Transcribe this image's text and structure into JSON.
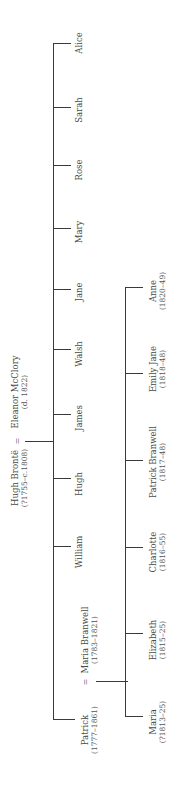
{
  "diagram": {
    "type": "family-tree",
    "orientation": "rotated-90-ccw",
    "line_color": "#3a3a3a",
    "text_color": "#4a4a4a",
    "marriage_symbol": "=",
    "generation1": {
      "husband": {
        "name": "Hugh Brontë",
        "dates": "(?1755–c.1808)"
      },
      "wife": {
        "name": "Eleanor McClory",
        "dates": "(d. 1822)"
      }
    },
    "generation2": [
      {
        "name": "Patrick",
        "dates": "(1777–1861)"
      },
      {
        "name": "William",
        "dates": ""
      },
      {
        "name": "Hugh",
        "dates": ""
      },
      {
        "name": "James",
        "dates": ""
      },
      {
        "name": "Walsh",
        "dates": ""
      },
      {
        "name": "Jane",
        "dates": ""
      },
      {
        "name": "Mary",
        "dates": ""
      },
      {
        "name": "Rose",
        "dates": ""
      },
      {
        "name": "Sarah",
        "dates": ""
      },
      {
        "name": "Alice",
        "dates": ""
      }
    ],
    "patrick_spouse": {
      "name": "Maria Branwell",
      "dates": "(1783–1821)"
    },
    "generation3": [
      {
        "name": "Maria",
        "dates": "(?1813–25)"
      },
      {
        "name": "Elizabeth",
        "dates": "(1815–25)"
      },
      {
        "name": "Charlotte",
        "dates": "(1816–55)"
      },
      {
        "name": "Patrick Branwell",
        "dates": "(1817–48)"
      },
      {
        "name": "Emily Jane",
        "dates": "(1818–48)"
      },
      {
        "name": "Anne",
        "dates": "(1820–49)"
      }
    ]
  }
}
